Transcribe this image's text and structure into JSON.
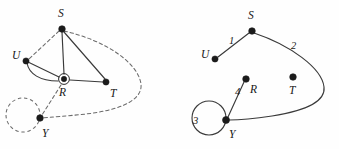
{
  "figure": {
    "background_color": "#fefefe",
    "node_color": "#1b1b1b",
    "solid_edge_color": "#3a3a3a",
    "dashed_edge_color": "#6b6b6b"
  },
  "left_diagram": {
    "name": "left-graph",
    "vertices": [
      {
        "id": "S",
        "label": "S",
        "x": 62,
        "y": 29,
        "label_x": 58,
        "label_y": 17
      },
      {
        "id": "U",
        "label": "U",
        "x": 26,
        "y": 61,
        "label_x": 12,
        "label_y": 59
      },
      {
        "id": "R",
        "label": "R",
        "x": 64,
        "y": 79,
        "label_x": 59,
        "label_y": 96
      },
      {
        "id": "T",
        "label": "T",
        "x": 106,
        "y": 82,
        "label_x": 110,
        "label_y": 97
      },
      {
        "id": "Y",
        "label": "Y",
        "x": 40,
        "y": 118,
        "label_x": 42,
        "label_y": 137
      }
    ],
    "marked_vertex": "R",
    "solid_edges": [
      {
        "from": "S",
        "to": "R",
        "style": "straight"
      },
      {
        "from": "S",
        "to": "T",
        "style": "straight"
      },
      {
        "from": "R",
        "to": "T",
        "style": "straight"
      },
      {
        "from": "U",
        "to": "R",
        "style": "straight"
      },
      {
        "from": "U",
        "to": "R",
        "style": "curved-parallel"
      }
    ],
    "dashed_edges": [
      {
        "from": "S",
        "to": "U",
        "style": "straight"
      },
      {
        "from": "R",
        "to": "Y",
        "style": "straight"
      },
      {
        "from": "S",
        "to": "Y",
        "style": "long-curve-right"
      }
    ],
    "dashed_self_loop": {
      "at": "Y",
      "center_x": 23,
      "center_y": 115,
      "radius": 17
    }
  },
  "right_diagram": {
    "name": "right-graph",
    "vertices": [
      {
        "id": "S",
        "label": "S",
        "x": 252,
        "y": 31,
        "label_x": 248,
        "label_y": 19
      },
      {
        "id": "U",
        "label": "U",
        "x": 215,
        "y": 59,
        "label_x": 201,
        "label_y": 58
      },
      {
        "id": "R",
        "label": "R",
        "x": 246,
        "y": 79,
        "label_x": 250,
        "label_y": 93
      },
      {
        "id": "T",
        "label": "T",
        "x": 293,
        "y": 77,
        "label_x": 289,
        "label_y": 94
      },
      {
        "id": "Y",
        "label": "Y",
        "x": 226,
        "y": 120,
        "label_x": 229,
        "label_y": 138
      }
    ],
    "solid_edges": [
      {
        "from": "S",
        "to": "U",
        "label": "1",
        "label_x": 229,
        "label_y": 44
      },
      {
        "from": "S",
        "to": "Y",
        "label": "2",
        "label_x": 291,
        "label_y": 49,
        "style": "long-curve-right"
      },
      {
        "from": "R",
        "to": "Y",
        "label": "4",
        "label_x": 235,
        "label_y": 95
      }
    ],
    "solid_self_loop": {
      "at": "Y",
      "label": "3",
      "label_x": 196,
      "label_y": 124,
      "center_x": 209,
      "center_y": 118,
      "radius": 17
    }
  }
}
